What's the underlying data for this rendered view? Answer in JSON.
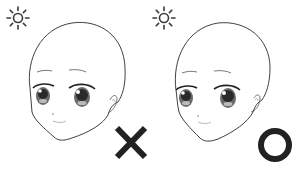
{
  "figure": {
    "light_source_icon": "sun-icon",
    "colors": {
      "line": "#2a2a2a",
      "mark": "#222222",
      "background": "#ffffff"
    },
    "panels": [
      {
        "id": "left",
        "verdict": "incorrect",
        "mark_icon": "x-mark-icon",
        "face_variant": "flat shading"
      },
      {
        "id": "right",
        "verdict": "correct",
        "mark_icon": "circle-mark-icon",
        "face_variant": "shaded"
      }
    ]
  }
}
